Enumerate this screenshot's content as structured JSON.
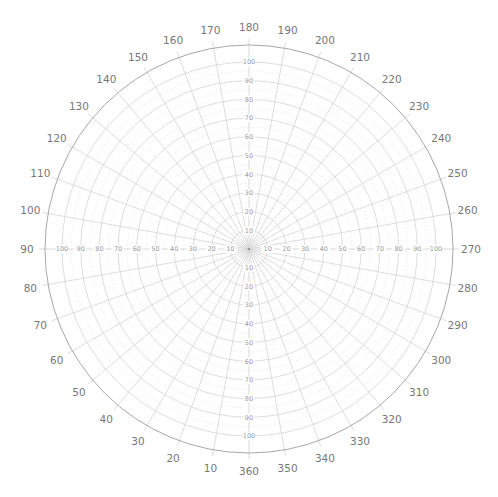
{
  "chart_data": {
    "type": "polar-grid",
    "title": "",
    "center_px": [
      249,
      249
    ],
    "radial": {
      "min": 0,
      "max": 100,
      "step": 10,
      "minor_step": 5,
      "tick_labels": [
        "10",
        "20",
        "30",
        "40",
        "50",
        "60",
        "70",
        "80",
        "90",
        "100"
      ],
      "label_axes": [
        "up",
        "down",
        "left",
        "right"
      ],
      "px_per_unit": 1.87,
      "outer_circle_radius_px": 204
    },
    "angular": {
      "step_deg": 10,
      "zero_position": "bottom",
      "direction": "clockwise",
      "tick_labels": [
        "360",
        "10",
        "20",
        "30",
        "40",
        "50",
        "60",
        "70",
        "80",
        "90",
        "100",
        "110",
        "120",
        "130",
        "140",
        "150",
        "160",
        "170",
        "180",
        "190",
        "200",
        "210",
        "220",
        "230",
        "240",
        "250",
        "260",
        "270",
        "280",
        "290",
        "300",
        "310",
        "320",
        "330",
        "340",
        "350"
      ],
      "label_radius_px": 222
    },
    "grid": true,
    "series": [],
    "colors": {
      "ring": "#d4d4d4",
      "outer": "#a8a8a8",
      "label": "#777777",
      "radial_label": "#9a9a9a"
    }
  }
}
